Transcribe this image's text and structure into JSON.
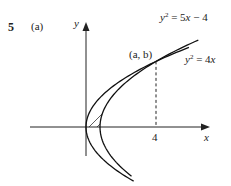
{
  "figure": {
    "problem_number": "5",
    "part_label": "(a)",
    "x_axis_label": "x",
    "y_axis_label": "y",
    "x_tick_label": "4",
    "intersection_label": "(a, b)",
    "curves": [
      {
        "name": "y^2 = 5x - 4",
        "lhs_base": "y",
        "lhs_exp": "2",
        "rhs_pre": " = 5",
        "rhs_var": "x",
        "rhs_post": " − 4",
        "vertex_x": 0.8
      },
      {
        "name": "y^2 = 4x",
        "lhs_base": "y",
        "lhs_exp": "2",
        "rhs_pre": " = 4",
        "rhs_var": "x",
        "rhs_post": "",
        "vertex_x": 0
      }
    ],
    "intersection_points": [
      {
        "x": 1,
        "y": 2
      },
      {
        "x": 4,
        "y": 4
      }
    ],
    "shaded_region": "between y^2 = 4x and y^2 = 5x - 4 for 0 <= y <= 4",
    "dashed_line_x": 4
  }
}
